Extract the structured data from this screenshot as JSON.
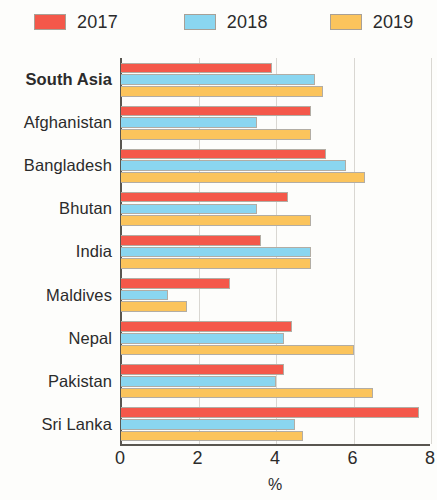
{
  "legend": {
    "items": [
      {
        "label": "2017",
        "color": "#f4584a"
      },
      {
        "label": "2018",
        "color": "#8ad6f0"
      },
      {
        "label": "2019",
        "color": "#fbc45c"
      }
    ]
  },
  "axis": {
    "ticks": [
      "0",
      "2",
      "4",
      "6",
      "8"
    ],
    "xlabel": "%"
  },
  "chart_data": {
    "type": "bar",
    "orientation": "horizontal",
    "title": "",
    "xlabel": "%",
    "ylabel": "",
    "xlim": [
      0,
      8
    ],
    "xticks": [
      0,
      2,
      4,
      6,
      8
    ],
    "grid": true,
    "legend_position": "top-left",
    "categories": [
      "South Asia",
      "Afghanistan",
      "Bangladesh",
      "Bhutan",
      "India",
      "Maldives",
      "Nepal",
      "Pakistan",
      "Sri Lanka"
    ],
    "emphasized_categories": [
      "South Asia"
    ],
    "series": [
      {
        "name": "2017",
        "color": "#f4584a",
        "values": [
          3.9,
          4.9,
          5.3,
          4.3,
          3.6,
          2.8,
          4.4,
          4.2,
          7.7
        ]
      },
      {
        "name": "2018",
        "color": "#8ad6f0",
        "values": [
          5.0,
          3.5,
          5.8,
          3.5,
          4.9,
          1.2,
          4.2,
          4.0,
          4.5
        ]
      },
      {
        "name": "2019",
        "color": "#fbc45c",
        "values": [
          5.2,
          4.9,
          6.3,
          4.9,
          4.9,
          1.7,
          6.0,
          6.5,
          4.7
        ]
      }
    ]
  }
}
